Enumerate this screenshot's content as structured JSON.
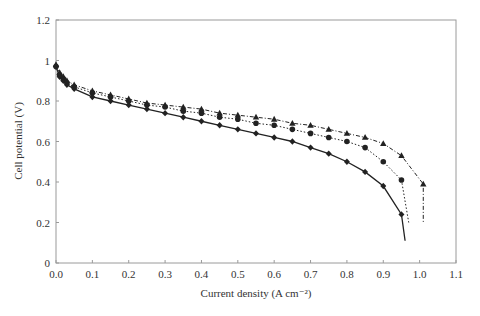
{
  "chart_data": {
    "type": "line",
    "title": "",
    "xlabel": "Current density (A cm⁻²)",
    "ylabel": "Cell potential (V)",
    "xlim": [
      0,
      1.1
    ],
    "ylim": [
      0,
      1.2
    ],
    "xticks": [
      "0.0",
      "0.1",
      "0.2",
      "0.3",
      "0.4",
      "0.5",
      "0.6",
      "0.7",
      "0.8",
      "0.9",
      "1.0",
      "1.1"
    ],
    "yticks": [
      "0",
      "0.2",
      "0.4",
      "0.6",
      "0.8",
      "1",
      "1.2"
    ],
    "grid": false,
    "legend": null,
    "series": [
      {
        "name": "diamond-solid",
        "marker": "diamond",
        "line": "solid",
        "x": [
          0.0,
          0.01,
          0.02,
          0.03,
          0.05,
          0.1,
          0.15,
          0.2,
          0.25,
          0.3,
          0.35,
          0.4,
          0.45,
          0.5,
          0.55,
          0.6,
          0.65,
          0.7,
          0.75,
          0.8,
          0.85,
          0.9,
          0.95
        ],
        "values": [
          0.97,
          0.92,
          0.9,
          0.88,
          0.86,
          0.82,
          0.8,
          0.78,
          0.76,
          0.74,
          0.72,
          0.7,
          0.68,
          0.66,
          0.64,
          0.62,
          0.6,
          0.57,
          0.54,
          0.5,
          0.45,
          0.38,
          0.24
        ],
        "curve_end": [
          0.96,
          0.11
        ]
      },
      {
        "name": "circle-dotted",
        "marker": "circle",
        "line": "dotted",
        "x": [
          0.0,
          0.01,
          0.02,
          0.03,
          0.05,
          0.1,
          0.15,
          0.2,
          0.25,
          0.3,
          0.35,
          0.4,
          0.45,
          0.5,
          0.55,
          0.6,
          0.65,
          0.7,
          0.75,
          0.8,
          0.85,
          0.9,
          0.95
        ],
        "values": [
          0.97,
          0.93,
          0.91,
          0.89,
          0.87,
          0.84,
          0.82,
          0.8,
          0.78,
          0.77,
          0.75,
          0.74,
          0.72,
          0.71,
          0.69,
          0.68,
          0.66,
          0.64,
          0.62,
          0.6,
          0.57,
          0.5,
          0.41
        ],
        "curve_end": [
          0.97,
          0.2
        ]
      },
      {
        "name": "triangle-dashdot",
        "marker": "triangle",
        "line": "dashdot",
        "x": [
          0.0,
          0.01,
          0.02,
          0.03,
          0.05,
          0.1,
          0.15,
          0.2,
          0.25,
          0.3,
          0.35,
          0.4,
          0.45,
          0.5,
          0.55,
          0.6,
          0.65,
          0.7,
          0.75,
          0.8,
          0.85,
          0.9,
          0.95,
          1.01
        ],
        "values": [
          0.98,
          0.94,
          0.92,
          0.9,
          0.88,
          0.85,
          0.83,
          0.81,
          0.79,
          0.78,
          0.77,
          0.76,
          0.74,
          0.73,
          0.72,
          0.71,
          0.69,
          0.68,
          0.66,
          0.64,
          0.62,
          0.59,
          0.53,
          0.39
        ],
        "curve_end": [
          1.01,
          0.2
        ]
      }
    ]
  },
  "style": {
    "line_color": "#222222",
    "axis_color": "#888888",
    "background": "#ffffff"
  }
}
